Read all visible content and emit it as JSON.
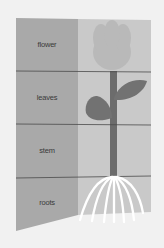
{
  "diagram": {
    "title": "",
    "parts": [
      {
        "label": "flower"
      },
      {
        "label": "leaves"
      },
      {
        "label": "stem"
      },
      {
        "label": "roots"
      }
    ]
  },
  "colors": {
    "background": "#f1f1f1",
    "left_panel": "#a9a9a9",
    "right_panel": "#c9c9c9",
    "flower_head": "#b9b9b9",
    "stem": "#6c6c6c",
    "leaves": "#727272",
    "roots": "#ffffff",
    "divider": "#4a4a4a"
  }
}
